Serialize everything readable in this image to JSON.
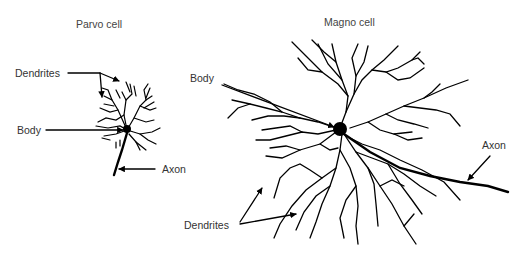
{
  "figure": {
    "panels": [
      {
        "title": "Parvo cell",
        "labels": {
          "dendrites": "Dendrites",
          "body": "Body",
          "axon": "Axon"
        }
      },
      {
        "title": "Magno cell",
        "labels": {
          "dendrites": "Dendrites",
          "body": "Body",
          "axon": "Axon"
        }
      }
    ],
    "colors": {
      "ink": "#000000",
      "text": "#333333",
      "background": "#ffffff"
    }
  }
}
